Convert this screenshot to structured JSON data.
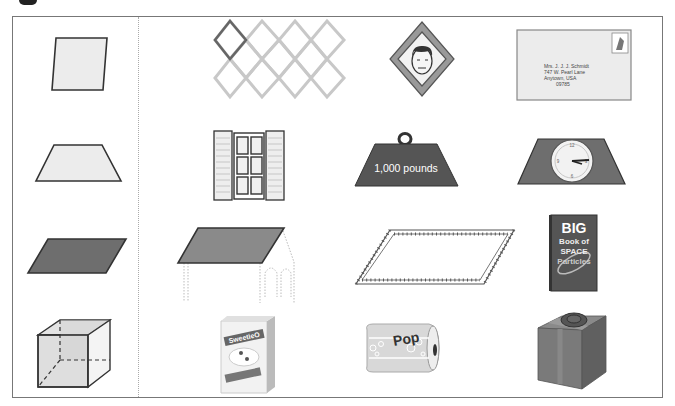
{
  "worksheet": {
    "layout": "4 rows x 4 columns; column 1 holds reference shapes, columns 2-4 hold real-world objects containing that shape",
    "reference_shapes": [
      {
        "row": 1,
        "name": "rhombus",
        "fill": "#ececec"
      },
      {
        "row": 2,
        "name": "trapezoid",
        "fill": "#ececec"
      },
      {
        "row": 3,
        "name": "parallelogram",
        "fill": "#777777"
      },
      {
        "row": 4,
        "name": "cube",
        "fill": "#d8d8d8"
      }
    ],
    "objects": {
      "row1": [
        {
          "name": "chain-link-fence"
        },
        {
          "name": "diamond-road-sign-with-face"
        },
        {
          "name": "envelope",
          "address_lines": [
            "Mrs. J. J. J. Schmidt",
            "747 W. Pearl Lane",
            "Anytown, USA",
            "09785"
          ]
        }
      ],
      "row2": [
        {
          "name": "window-with-shutters"
        },
        {
          "name": "weight",
          "label": "1,000 pounds"
        },
        {
          "name": "trapezoid-clock"
        }
      ],
      "row3": [
        {
          "name": "house-roof"
        },
        {
          "name": "ruler-parallelogram"
        },
        {
          "name": "book",
          "title_lines": [
            "BIG",
            "Book of",
            "SPACE",
            "Particles"
          ]
        }
      ],
      "row4": [
        {
          "name": "cereal-box",
          "brand": "SweetieO",
          "subtitle": "Whole Grain Goodness"
        },
        {
          "name": "soda-can",
          "label": "Pop"
        },
        {
          "name": "gift-box"
        }
      ]
    },
    "colors": {
      "frame": "#777777",
      "dark_fill": "#6e6e6e",
      "light_fill": "#ececec",
      "outline": "#333333"
    }
  }
}
